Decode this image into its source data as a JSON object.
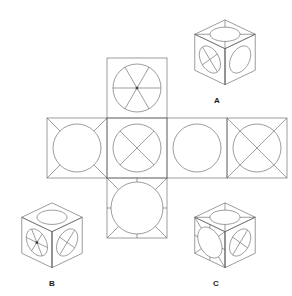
{
  "puzzle": {
    "type": "cube-net-folding",
    "title": "Cube net and three candidate folded cubes",
    "stroke_color": "#5a5a5a",
    "label_color": "#1a1a1a",
    "background_color": "#ffffff",
    "stroke_width": 0.6
  },
  "net": {
    "name": "cube-net",
    "cell_size": 60,
    "origin_x": 47,
    "origin_y": 118,
    "layout": "cross",
    "faces": [
      {
        "id": "net-face-top",
        "label": "top",
        "grid_col": 1,
        "grid_row": 0,
        "x": 107,
        "y": 58,
        "pattern": "circle-6-spokes",
        "pattern_description": "circle with six spokes radiating from center",
        "circle_radius": 24,
        "spoke_count": 6,
        "spokes_inside": true
      },
      {
        "id": "net-face-left",
        "label": "left",
        "grid_col": 0,
        "grid_row": 1,
        "x": 47,
        "y": 118,
        "pattern": "circle-corner-rays",
        "pattern_description": "circle with four corner diagonal rays outside the circle",
        "circle_radius": 24,
        "spoke_count": 4,
        "spokes_inside": false
      },
      {
        "id": "net-face-front",
        "label": "front",
        "grid_col": 1,
        "grid_row": 1,
        "x": 107,
        "y": 118,
        "pattern": "circle-x-inside",
        "pattern_description": "circle with an X of four spokes inside the circle",
        "circle_radius": 24,
        "spoke_count": 4,
        "spokes_inside": true
      },
      {
        "id": "net-face-right",
        "label": "right",
        "grid_col": 2,
        "grid_row": 1,
        "x": 167,
        "y": 118,
        "pattern": "circle-plain",
        "pattern_description": "plain circle with no spokes",
        "circle_radius": 24,
        "spoke_count": 0,
        "spokes_inside": false
      },
      {
        "id": "net-face-back",
        "label": "back",
        "grid_col": 3,
        "grid_row": 1,
        "x": 227,
        "y": 118,
        "pattern": "circle-full-diagonals",
        "pattern_description": "circle crossed by full corner-to-corner diagonals",
        "circle_radius": 24,
        "spoke_count": 4,
        "spokes_inside": true
      },
      {
        "id": "net-face-bottom",
        "label": "bottom",
        "grid_col": 1,
        "grid_row": 2,
        "x": 107,
        "y": 178,
        "pattern": "big-circle-8-outer-rays",
        "pattern_description": "large circle with eight rays outside: four to corners and four to edge midpoints",
        "circle_radius": 26,
        "spoke_count": 8,
        "spokes_inside": false
      }
    ]
  },
  "options": [
    {
      "id": "cube-a",
      "label": "A",
      "label_x": 217,
      "label_y": 101,
      "center_x": 225,
      "center_y": 53,
      "size": 36,
      "faces": {
        "top": {
          "pattern": "ellipse-corner-rays",
          "pattern_description": "ellipse with four corner rays outside"
        },
        "left": {
          "pattern": "ellipse-x-inside",
          "pattern_description": "ellipse with an X of four spokes inside"
        },
        "right": {
          "pattern": "ellipse-plain",
          "pattern_description": "plain ellipse with no spokes"
        }
      }
    },
    {
      "id": "cube-b",
      "label": "B",
      "label_x": 52,
      "label_y": 284,
      "center_x": 52,
      "center_y": 236,
      "size": 36,
      "faces": {
        "top": {
          "pattern": "ellipse-plain",
          "pattern_description": "plain ellipse with no spokes"
        },
        "left": {
          "pattern": "ellipse-6-spokes",
          "pattern_description": "ellipse with six spokes radiating from center"
        },
        "right": {
          "pattern": "ellipse-x-inside",
          "pattern_description": "ellipse with an X of four spokes inside"
        }
      }
    },
    {
      "id": "cube-c",
      "label": "C",
      "label_x": 216,
      "label_y": 284,
      "center_x": 225,
      "center_y": 236,
      "size": 36,
      "faces": {
        "top": {
          "pattern": "ellipse-corner-rays",
          "pattern_description": "ellipse with four corner rays outside"
        },
        "left": {
          "pattern": "big-ellipse-8-outer-rays",
          "pattern_description": "large ellipse with eight rays outside to corners and edge midpoints"
        },
        "right": {
          "pattern": "ellipse-x-inside",
          "pattern_description": "ellipse with an X of four spokes inside"
        }
      }
    }
  ]
}
